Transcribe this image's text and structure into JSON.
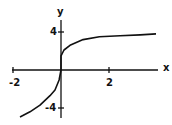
{
  "chart_data": {
    "type": "line",
    "title": "",
    "xlabel": "x",
    "ylabel": "y",
    "x_ticks": [
      {
        "value": -2,
        "label": "-2"
      },
      {
        "value": 2,
        "label": "2"
      }
    ],
    "y_ticks": [
      {
        "value": 4,
        "label": "4"
      },
      {
        "value": -4,
        "label": "-4"
      }
    ],
    "xlim": [
      -2.05,
      4.1
    ],
    "ylim": [
      -5,
      5.4
    ],
    "grid": false,
    "legend": null,
    "series": [
      {
        "name": "curve",
        "color": "#111111",
        "points": [
          [
            -1.71,
            -4.95
          ],
          [
            -1.29,
            -4.4
          ],
          [
            -0.875,
            -3.7
          ],
          [
            -0.46,
            -2.7
          ],
          [
            -0.25,
            -2.1
          ],
          [
            -0.08,
            -1.05
          ],
          [
            0,
            0
          ],
          [
            0,
            1.5
          ],
          [
            0.125,
            2.1
          ],
          [
            0.375,
            2.6
          ],
          [
            0.92,
            3.2
          ],
          [
            1.6,
            3.5
          ],
          [
            2.46,
            3.6
          ],
          [
            3.3,
            3.7
          ],
          [
            3.96,
            3.8
          ]
        ]
      }
    ]
  },
  "labels": {
    "x_axis": "x",
    "y_axis": "y",
    "x_tick_neg2": "-2",
    "x_tick_2": "2",
    "y_tick_4": "4",
    "y_tick_neg4": "-4"
  },
  "colors": {
    "axis": "#111111",
    "curve": "#111111",
    "background": "#ffffff"
  }
}
